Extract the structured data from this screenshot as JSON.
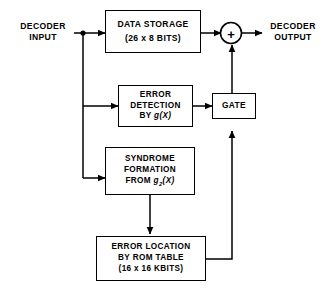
{
  "diagram": {
    "stroke_color": "#000000",
    "background_color": "#ffffff",
    "blocks": [
      {
        "id": "data-storage",
        "name": "data-storage-block",
        "lines": [
          "DATA STORAGE",
          "(26 x 8 BITS)"
        ]
      },
      {
        "id": "error-detection",
        "name": "error-detection-block",
        "lines": [
          "ERROR",
          "DETECTION",
          "BY g(X)"
        ]
      },
      {
        "id": "gate",
        "name": "gate-block",
        "lines": [
          "GATE"
        ]
      },
      {
        "id": "syndrome",
        "name": "syndrome-formation-block",
        "lines": [
          "SYNDROME",
          "FORMATION",
          "FROM g2(X)"
        ]
      },
      {
        "id": "rom-table",
        "name": "error-location-rom-block",
        "lines": [
          "ERROR LOCATION",
          "BY ROM TABLE",
          "(16 x 16 KBITS)"
        ]
      }
    ],
    "labels": {
      "input_line1": "DECODER",
      "input_line2": "INPUT",
      "output_line1": "DECODER",
      "output_line2": "OUTPUT"
    },
    "adder": {
      "symbol": "+",
      "name": "summing-junction"
    },
    "block_text": {
      "data_storage_l1": "DATA STORAGE",
      "data_storage_l2": "(26 x 8 BITS)",
      "error_detection_l1": "ERROR",
      "error_detection_l2": "DETECTION",
      "error_detection_l3_prefix": "BY ",
      "error_detection_l3_fn": "g",
      "error_detection_l3_arg": "(X)",
      "gate_l1": "GATE",
      "syndrome_l1": "SYNDROME",
      "syndrome_l2": "FORMATION",
      "syndrome_l3_prefix": "FROM ",
      "syndrome_l3_fn": "g",
      "syndrome_l3_sub": "2",
      "syndrome_l3_arg": "(X)",
      "rom_l1": "ERROR LOCATION",
      "rom_l2": "BY ROM TABLE",
      "rom_l3": "(16 x 16 KBITS)"
    }
  }
}
